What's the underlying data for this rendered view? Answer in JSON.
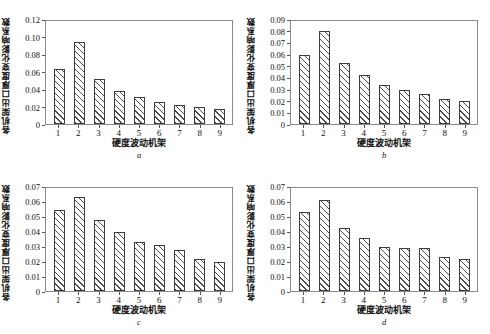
{
  "figure": {
    "panels": [
      {
        "letter": "a",
        "xlabel": "硬度波动机架",
        "ylabel": "各机架出口厚度变化影响系数",
        "yticks": [
          "0",
          "0.02",
          "0.04",
          "0.06",
          "0.08",
          "0.10",
          "0.12"
        ],
        "xticks": [
          "1",
          "2",
          "3",
          "4",
          "5",
          "6",
          "7",
          "8",
          "9"
        ]
      },
      {
        "letter": "b",
        "xlabel": "硬度波动机架",
        "ylabel": "各机架出口厚度变化影响系数",
        "yticks": [
          "0",
          "0.01",
          "0.02",
          "0.03",
          "0.04",
          "0.05",
          "0.06",
          "0.07",
          "0.08",
          "0.09"
        ],
        "xticks": [
          "1",
          "2",
          "3",
          "4",
          "5",
          "6",
          "7",
          "8",
          "9"
        ]
      },
      {
        "letter": "c",
        "xlabel": "硬度波动机架",
        "ylabel": "各机架出口厚度变化影响系数",
        "yticks": [
          "0",
          "0.01",
          "0.02",
          "0.03",
          "0.04",
          "0.05",
          "0.06",
          "0.07"
        ],
        "xticks": [
          "1",
          "2",
          "3",
          "4",
          "5",
          "6",
          "7",
          "8",
          "9"
        ]
      },
      {
        "letter": "d",
        "xlabel": "硬度波动机架",
        "ylabel": "各机架出口厚度变化影响系数",
        "yticks": [
          "0",
          "0.01",
          "0.02",
          "0.03",
          "0.04",
          "0.05",
          "0.06",
          "0.07"
        ],
        "xticks": [
          "1",
          "2",
          "3",
          "4",
          "5",
          "6",
          "7",
          "8",
          "9"
        ]
      }
    ]
  },
  "chart_data": [
    {
      "type": "bar",
      "title": "a",
      "xlabel": "硬度波动机架",
      "ylabel": "各机架出口厚度变化影响系数",
      "categories": [
        "1",
        "2",
        "3",
        "4",
        "5",
        "6",
        "7",
        "8",
        "9"
      ],
      "values": [
        0.064,
        0.096,
        0.052,
        0.039,
        0.032,
        0.026,
        0.022,
        0.02,
        0.017
      ],
      "ylim": [
        0,
        0.12
      ],
      "ytick_step": 0.02,
      "grid": false,
      "legend": false,
      "bar_style": "diagonal-hatch"
    },
    {
      "type": "bar",
      "title": "b",
      "xlabel": "硬度波动机架",
      "ylabel": "各机架出口厚度变化影响系数",
      "categories": [
        "1",
        "2",
        "3",
        "4",
        "5",
        "6",
        "7",
        "8",
        "9"
      ],
      "values": [
        0.06,
        0.081,
        0.053,
        0.043,
        0.034,
        0.03,
        0.026,
        0.022,
        0.02
      ],
      "ylim": [
        0,
        0.09
      ],
      "ytick_step": 0.01,
      "grid": false,
      "legend": false,
      "bar_style": "diagonal-hatch"
    },
    {
      "type": "bar",
      "title": "c",
      "xlabel": "硬度波动机架",
      "ylabel": "各机架出口厚度变化影响系数",
      "categories": [
        "1",
        "2",
        "3",
        "4",
        "5",
        "6",
        "7",
        "8",
        "9"
      ],
      "values": [
        0.055,
        0.064,
        0.048,
        0.04,
        0.033,
        0.031,
        0.028,
        0.022,
        0.02
      ],
      "ylim": [
        0,
        0.07
      ],
      "ytick_step": 0.01,
      "grid": false,
      "legend": false,
      "bar_style": "diagonal-hatch"
    },
    {
      "type": "bar",
      "title": "d",
      "xlabel": "硬度波动机架",
      "ylabel": "各机架出口厚度变化影响系数",
      "categories": [
        "1",
        "2",
        "3",
        "4",
        "5",
        "6",
        "7",
        "8",
        "9"
      ],
      "values": [
        0.054,
        0.062,
        0.043,
        0.036,
        0.03,
        0.029,
        0.029,
        0.023,
        0.022
      ],
      "ylim": [
        0,
        0.07
      ],
      "ytick_step": 0.01,
      "grid": false,
      "legend": false,
      "bar_style": "diagonal-hatch"
    }
  ]
}
